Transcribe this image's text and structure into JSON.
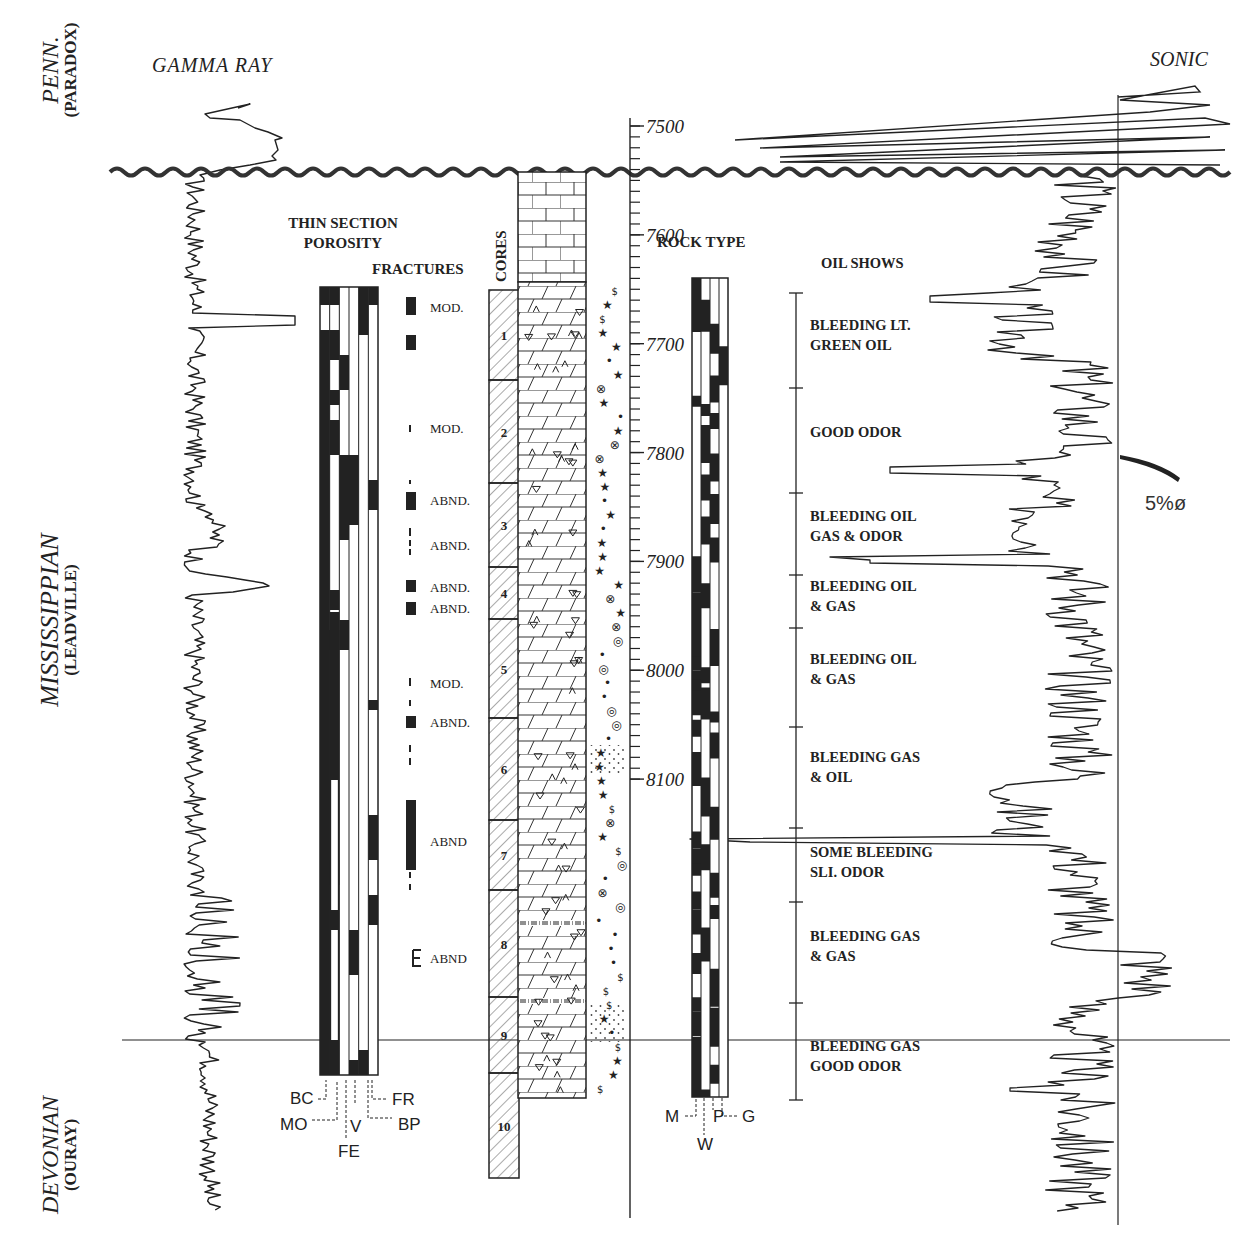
{
  "formations": [
    {
      "name": "PENN.",
      "sub": "(PARADOX)",
      "y_center": 70
    },
    {
      "name": "MISSISSIPPIAN",
      "sub": "(LEADVILLE)",
      "y_center": 620
    },
    {
      "name": "DEVONIAN",
      "sub": "(OURAY)",
      "y_center": 1155
    }
  ],
  "headers": {
    "gamma_ray": "GAMMA RAY",
    "sonic": "SONIC",
    "thin_section_1": "THIN SECTION",
    "thin_section_2": "POROSITY",
    "fractures": "FRACTURES",
    "cores": "CORES",
    "rock_type": "ROCK TYPE",
    "oil_shows": "OIL SHOWS"
  },
  "depth_axis": {
    "unit": "ft",
    "min": 7490,
    "max": 8100,
    "labels": [
      {
        "depth": 7500,
        "label": "7500"
      },
      {
        "depth": 7600,
        "label": "7600"
      },
      {
        "depth": 7700,
        "label": "7700"
      },
      {
        "depth": 7800,
        "label": "7800"
      },
      {
        "depth": 7900,
        "label": "7900"
      },
      {
        "depth": 8000,
        "label": "8000"
      },
      {
        "depth": 8100,
        "label": "8100"
      }
    ],
    "minor_tick_interval": 10
  },
  "unconformities": {
    "penn_miss_wavy_y": 172,
    "miss_devonian_line_y": 1040
  },
  "fractures": [
    {
      "label": "MOD.",
      "y": 307
    },
    {
      "label": "MOD.",
      "y": 428
    },
    {
      "label": "ABND.",
      "y": 500
    },
    {
      "label": "ABND.",
      "y": 545
    },
    {
      "label": "ABND.",
      "y": 587
    },
    {
      "label": "ABND.",
      "y": 608
    },
    {
      "label": "MOD.",
      "y": 683
    },
    {
      "label": "ABND.",
      "y": 722
    },
    {
      "label": "ABND",
      "y": 841
    },
    {
      "label": "ABND",
      "y": 958
    }
  ],
  "cores": [
    {
      "num": "1",
      "top": 290,
      "bottom": 380
    },
    {
      "num": "2",
      "top": 380,
      "bottom": 483
    },
    {
      "num": "3",
      "top": 483,
      "bottom": 567
    },
    {
      "num": "4",
      "top": 567,
      "bottom": 619
    },
    {
      "num": "5",
      "top": 619,
      "bottom": 718
    },
    {
      "num": "6",
      "top": 718,
      "bottom": 820
    },
    {
      "num": "7",
      "top": 820,
      "bottom": 890
    },
    {
      "num": "8",
      "top": 890,
      "bottom": 997
    },
    {
      "num": "9",
      "top": 997,
      "bottom": 1073
    },
    {
      "num": "10",
      "top": 1073,
      "bottom": 1178
    }
  ],
  "oil_shows": [
    {
      "lines": [
        "OIL SHOWS"
      ],
      "y": 268,
      "header": true
    },
    {
      "lines": [
        "BLEEDING LT.",
        "GREEN OIL"
      ],
      "y": 330
    },
    {
      "lines": [
        "GOOD ODOR"
      ],
      "y": 437
    },
    {
      "lines": [
        "BLEEDING OIL",
        "GAS & ODOR"
      ],
      "y": 521
    },
    {
      "lines": [
        "BLEEDING OIL",
        "& GAS"
      ],
      "y": 591
    },
    {
      "lines": [
        "BLEEDING OIL",
        "& GAS"
      ],
      "y": 664
    },
    {
      "lines": [
        "BLEEDING GAS",
        "& OIL"
      ],
      "y": 762
    },
    {
      "lines": [
        "SOME BLEEDING",
        "SLI. ODOR"
      ],
      "y": 857
    },
    {
      "lines": [
        "BLEEDING GAS",
        "& GAS"
      ],
      "y": 941
    },
    {
      "lines": [
        "BLEEDING GAS",
        "GOOD ODOR"
      ],
      "y": 1051
    }
  ],
  "oil_show_ticks": [
    293,
    388,
    493,
    575,
    628,
    727,
    828,
    902,
    1003,
    1100
  ],
  "porosity_legend": [
    "BC",
    "MO",
    "FE",
    "V",
    "BP",
    "FR"
  ],
  "rock_type_legend": [
    "M",
    "W",
    "P",
    "G"
  ],
  "sonic_annotation": "5%ø",
  "colors": {
    "ink": "#222222",
    "paper": "#ffffff",
    "hatch": "#555555"
  }
}
